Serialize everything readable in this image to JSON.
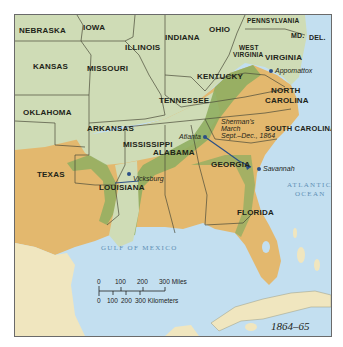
{
  "map": {
    "title_year": "1864–65",
    "colors": {
      "union_land": "#cfdcb6",
      "confederate_land": "#e3b86e",
      "frontier_band": "#8fae62",
      "water": "#c3dff0",
      "foreign_land": "#f0e6bf",
      "border": "#4b4a3a",
      "route": "#2b4f86"
    },
    "states": {
      "nebraska": "NEBRASKA",
      "iowa": "IOWA",
      "illinois": "ILLINOIS",
      "indiana": "INDIANA",
      "ohio": "OHIO",
      "pennsylvania": "PENNSYLVANIA",
      "maryland": "MD.",
      "delaware": "DEL.",
      "kansas": "KANSAS",
      "missouri": "MISSOURI",
      "west_virginia_1": "WEST",
      "west_virginia_2": "VIRGINIA",
      "virginia": "VIRGINIA",
      "kentucky": "KENTUCKY",
      "oklahoma": "OKLAHOMA",
      "tennessee": "TENNESSEE",
      "north_carolina_1": "NORTH",
      "north_carolina_2": "CAROLINA",
      "arkansas": "ARKANSAS",
      "mississippi": "MISSISSIPPI",
      "south_carolina": "SOUTH CAROLINA",
      "texas": "TEXAS",
      "alabama": "ALABAMA",
      "georgia": "GEORGIA",
      "louisiana": "LOUISIANA",
      "florida": "FLORIDA"
    },
    "cities": {
      "appomattox": "Appomattox",
      "atlanta": "Atlanta",
      "vicksburg": "Vicksburg",
      "savannah": "Savannah"
    },
    "annotations": {
      "sherman_1": "Sherman's",
      "sherman_2": "March",
      "sherman_3": "Sept.–Dec., 1864"
    },
    "water_bodies": {
      "atlantic_1": "ATLANTIC",
      "atlantic_2": "OCEAN",
      "gulf": "GULF OF MEXICO"
    },
    "scale_bar": {
      "miles_ticks": [
        "0",
        "100",
        "200",
        "300 Miles"
      ],
      "km_ticks": [
        "0",
        "100",
        "200",
        "300 Kilometers"
      ]
    }
  }
}
